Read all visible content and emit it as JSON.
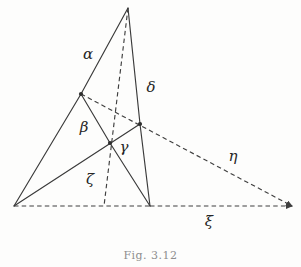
{
  "figure": {
    "kind": "geometry-diagram",
    "background_color": "#fdfdfc",
    "stroke_color": "#3a3a3a",
    "caption": "Fig. 3.12",
    "labels": {
      "alpha": "α",
      "beta": "β",
      "gamma": "γ",
      "delta": "δ",
      "zeta": "ζ",
      "eta": "η",
      "xi": "ξ"
    }
  },
  "chart_data": {
    "type": "diagram",
    "title": "Fig. 3.12",
    "xlabel": "",
    "ylabel": "",
    "xlim": [
      0,
      301
    ],
    "ylim": [
      0,
      267
    ],
    "grid": false,
    "legend": "none",
    "points": [
      {
        "id": "apex",
        "name": "apex-vertex",
        "x": 128,
        "y": 8,
        "marker": false
      },
      {
        "id": "base_left",
        "name": "base-left-vertex",
        "x": 14,
        "y": 206,
        "marker": false
      },
      {
        "id": "base_mid",
        "name": "base-mid-vertex",
        "x": 150,
        "y": 206,
        "marker": false
      },
      {
        "id": "base_right",
        "name": "base-right-endpoint",
        "x": 292,
        "y": 206,
        "marker": false
      },
      {
        "id": "node_alpha",
        "name": "node-on-alpha-side",
        "x": 81,
        "y": 94,
        "marker": true
      },
      {
        "id": "node_center",
        "name": "central-node",
        "x": 110,
        "y": 143,
        "marker": true
      },
      {
        "id": "node_delta",
        "name": "node-on-delta-side",
        "x": 140,
        "y": 124,
        "marker": true
      },
      {
        "id": "foot_zeta",
        "name": "zeta-foot-on-base",
        "x": 104,
        "y": 206,
        "marker": false
      }
    ],
    "segments": [
      {
        "id": "s_alpha_upper",
        "name": "segment-alpha-upper",
        "from": "apex",
        "to": "node_alpha",
        "style": "solid",
        "label": "α"
      },
      {
        "id": "s_alpha_lower",
        "name": "segment-alpha-lower",
        "from": "node_alpha",
        "to": "base_left",
        "style": "solid",
        "label": ""
      },
      {
        "id": "s_delta",
        "name": "segment-delta",
        "from": "apex",
        "to": "node_delta",
        "style": "solid",
        "label": "δ"
      },
      {
        "id": "s_delta_lower",
        "name": "segment-delta-lower",
        "from": "node_delta",
        "to": "base_mid",
        "style": "solid",
        "label": ""
      },
      {
        "id": "s_beta",
        "name": "segment-beta",
        "from": "node_alpha",
        "to": "node_center",
        "style": "solid",
        "label": "β"
      },
      {
        "id": "s_gamma",
        "name": "segment-gamma",
        "from": "node_center",
        "to": "base_mid",
        "style": "solid",
        "label": "γ"
      },
      {
        "id": "s_cevian_left",
        "name": "segment-left-cevian",
        "from": "base_left",
        "to": "node_delta",
        "style": "solid",
        "label": ""
      },
      {
        "id": "s_base_solid",
        "name": "segment-base-left-to-mid",
        "from": "base_left",
        "to": "base_mid",
        "style": "dashed",
        "label": ""
      },
      {
        "id": "s_zeta",
        "name": "segment-zeta-median",
        "from": "apex",
        "to": "foot_zeta",
        "style": "dashed",
        "label": "ζ"
      },
      {
        "id": "s_eta",
        "name": "segment-eta",
        "from": "node_alpha",
        "to": "base_right",
        "style": "dashed",
        "label": "η"
      },
      {
        "id": "s_xi",
        "name": "segment-xi-baseline",
        "from": "base_mid",
        "to": "base_right",
        "style": "dashed",
        "label": "ξ"
      }
    ],
    "label_positions": [
      {
        "name": "label-alpha",
        "text": "α",
        "x": 88,
        "y": 55
      },
      {
        "name": "label-delta",
        "text": "δ",
        "x": 151,
        "y": 88
      },
      {
        "name": "label-beta",
        "text": "β",
        "x": 84,
        "y": 128
      },
      {
        "name": "label-gamma",
        "text": "γ",
        "x": 124,
        "y": 148
      },
      {
        "name": "label-zeta",
        "text": "ζ",
        "x": 90,
        "y": 180
      },
      {
        "name": "label-eta",
        "text": "η",
        "x": 233,
        "y": 157
      },
      {
        "name": "label-xi",
        "text": "ξ",
        "x": 209,
        "y": 222
      }
    ]
  }
}
